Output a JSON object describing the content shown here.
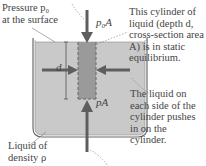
{
  "labels": {
    "surface_pressure": [
      "Pressure p₀",
      "at the surface"
    ],
    "top_force": "p₀A",
    "bottom_force": "pA",
    "depth": "d",
    "liquid": [
      "Liquid of",
      "density ρ"
    ],
    "cylinder_note": [
      "This cylinder of",
      "liquid (depth d,",
      "cross-section area",
      "A) is in static",
      "equilibrium."
    ],
    "side_note": [
      "The liquid on",
      "each side of the",
      "cylinder pushes",
      "in on the",
      "cylinder."
    ]
  },
  "colors": {
    "liquid": "#c9c9c9",
    "cylinder": "#9a9a9a",
    "arrow": "#5e5e5e",
    "container": "#6a6a6a",
    "background": "#ffffff"
  }
}
